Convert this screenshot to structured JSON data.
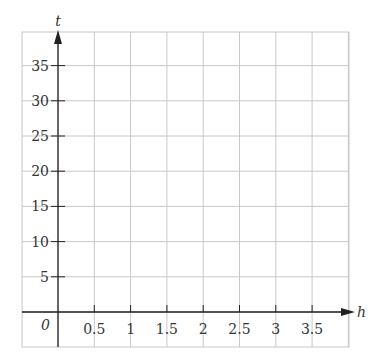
{
  "chart_data": {
    "type": "line",
    "title": "",
    "xlabel": "h",
    "ylabel": "t",
    "origin_label": "0",
    "x_ticks": [
      "0.5",
      "1",
      "1.5",
      "2",
      "2.5",
      "3",
      "3.5"
    ],
    "x_tick_values": [
      0.5,
      1,
      1.5,
      2,
      2.5,
      3,
      3.5
    ],
    "y_ticks": [
      "5",
      "10",
      "15",
      "20",
      "25",
      "30",
      "35"
    ],
    "y_tick_values": [
      5,
      10,
      15,
      20,
      25,
      30,
      35
    ],
    "xlim": [
      -0.5,
      4.0
    ],
    "ylim": [
      -5,
      40
    ],
    "grid": true,
    "series": [],
    "colors": {
      "grid": "#c8c8c8",
      "axis": "#222222",
      "text": "#333333"
    }
  }
}
